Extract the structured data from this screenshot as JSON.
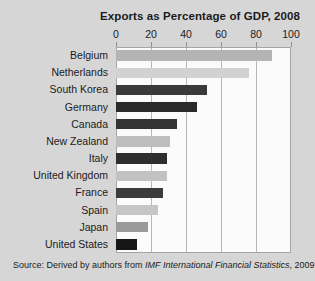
{
  "chart_data": {
    "type": "bar",
    "orientation": "horizontal",
    "title": "Exports as Percentage of GDP, 2008",
    "xlabel": "",
    "ylabel": "",
    "xlim": [
      0,
      100
    ],
    "xticks": [
      0,
      20,
      40,
      60,
      80,
      100
    ],
    "xtick_labels": [
      "0",
      "20",
      "40",
      "60",
      "80",
      "100"
    ],
    "grid": true,
    "legend": false,
    "categories": [
      "Belgium",
      "Netherlands",
      "South Korea",
      "Germany",
      "Canada",
      "New Zealand",
      "Italy",
      "United Kingdom",
      "France",
      "Spain",
      "Japan",
      "United States"
    ],
    "values": [
      89,
      76,
      52,
      46,
      35,
      31,
      29,
      29,
      27,
      24,
      18,
      12
    ],
    "bar_colors": [
      "#b4b4b4",
      "#d2d2d2",
      "#3a3a3a",
      "#2a2a2a",
      "#333333",
      "#bdbdbd",
      "#2e2e2e",
      "#c2c2c2",
      "#3b3b3b",
      "#c6c6c6",
      "#9a9a9a",
      "#161616"
    ]
  },
  "source": {
    "prefix": "Source:  Derived by authors from ",
    "italic": "IMF International Financial Statistics",
    "suffix": ", 2009."
  },
  "colors": {
    "background": "#d6d6d6",
    "plot_background": "#fbfbfb",
    "gridline": "#b8b8b8",
    "text": "#1b1b1b"
  }
}
